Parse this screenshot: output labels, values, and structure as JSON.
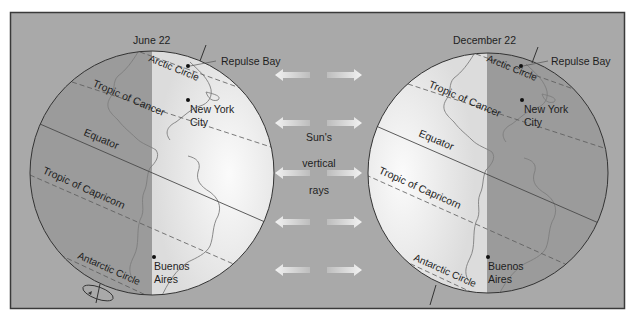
{
  "colors": {
    "frame_bg": "#a9a9a9",
    "frame_border": "#3a3a3a",
    "shadow_side": "#9a9a9a",
    "lit_side": "#e6e6e6",
    "lit_highlight": "#fafafa",
    "line": "#4a4a4a",
    "coast": "#7a7a7a",
    "arrow": "#e2e2e2"
  },
  "center_label": {
    "line1": "Sun's",
    "line2": "vertical",
    "line3": "rays"
  },
  "globes": [
    {
      "id": "june",
      "date_label": "June 22",
      "lit_side": "right",
      "labels": {
        "arctic_circle": "Arctic Circle",
        "tropic_cancer": "Tropic of Cancer",
        "equator": "Equator",
        "tropic_capricorn": "Tropic of Capricorn",
        "antarctic_circle": "Antarctic Circle",
        "repulse_bay": "Repulse Bay",
        "new_york_1": "New York",
        "new_york_2": "City",
        "buenos_aires_1": "Buenos",
        "buenos_aires_2": "Aires"
      }
    },
    {
      "id": "december",
      "date_label": "December 22",
      "lit_side": "left",
      "labels": {
        "arctic_circle": "Arctic Circle",
        "tropic_cancer": "Tropic of Cancer",
        "equator": "Equator",
        "tropic_capricorn": "Tropic of Capricorn",
        "antarctic_circle": "Antarctic Circle",
        "repulse_bay": "Repulse Bay",
        "new_york_1": "New York",
        "new_york_2": "City",
        "buenos_aires_1": "Buenos",
        "buenos_aires_2": "Aires"
      }
    }
  ],
  "arrow_rows_y": [
    75,
    123,
    173,
    222,
    270
  ]
}
